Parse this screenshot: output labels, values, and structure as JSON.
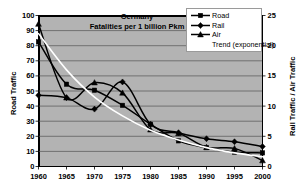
{
  "chart_data": {
    "type": "line",
    "title": "Germany",
    "subtitle": "Fatalities per 1 billion Pkm",
    "xlabel": "",
    "ylabel": "Road Traffic",
    "y2label": "Rail Traffic / Air Traffic",
    "x": [
      1960,
      1965,
      1970,
      1975,
      1980,
      1985,
      1990,
      1995,
      2000
    ],
    "xticklabels": [
      "1960",
      "1965",
      "1970",
      "1975",
      "1980",
      "1985",
      "1990",
      "1995",
      "2000"
    ],
    "ylim": [
      0,
      100
    ],
    "yticks": [
      0,
      10,
      20,
      30,
      40,
      50,
      60,
      70,
      80,
      90,
      100
    ],
    "yticklabels": [
      "0",
      "10",
      "20",
      "30",
      "40",
      "50",
      "60",
      "70",
      "80",
      "90",
      "100"
    ],
    "y2lim": [
      0,
      25
    ],
    "y2ticks": [
      0,
      5,
      10,
      15,
      20,
      25
    ],
    "y2ticklabels": [
      "0",
      "5",
      "10",
      "15",
      "20",
      "25"
    ],
    "grid": true,
    "grid_axis": "y",
    "legend_position": "top-right",
    "plot_bg": "#b3b3b3",
    "series": [
      {
        "name": "Road",
        "axis": "left",
        "marker": "square",
        "color": "#000000",
        "values": [
          82.5,
          54.5,
          50.5,
          40.5,
          28.0,
          17.0,
          12.5,
          9.5,
          9.0
        ]
      },
      {
        "name": "Rail",
        "axis": "right",
        "marker": "diamond",
        "color": "#000000",
        "values": [
          11.8,
          11.4,
          9.5,
          14.0,
          7.0,
          5.6,
          4.6,
          4.1,
          3.3
        ]
      },
      {
        "name": "Air",
        "axis": "right",
        "marker": "triangle",
        "color": "#000000",
        "values": [
          23.6,
          11.4,
          13.9,
          12.2,
          6.1,
          5.5,
          3.2,
          3.0,
          1.0
        ]
      },
      {
        "name": "Trend (exponential)",
        "axis": "left",
        "marker": "none",
        "color": "#ffffff",
        "values": [
          88.0,
          64.0,
          46.0,
          33.5,
          24.0,
          17.5,
          12.5,
          9.0,
          6.5
        ]
      }
    ],
    "legend": [
      {
        "label": "Road",
        "marker": "square",
        "color": "#000000"
      },
      {
        "label": "Rail",
        "marker": "diamond",
        "color": "#000000"
      },
      {
        "label": "Air",
        "marker": "triangle",
        "color": "#000000"
      },
      {
        "label": "Trend (exponential)",
        "marker": "none",
        "color": "#ffffff"
      }
    ]
  }
}
